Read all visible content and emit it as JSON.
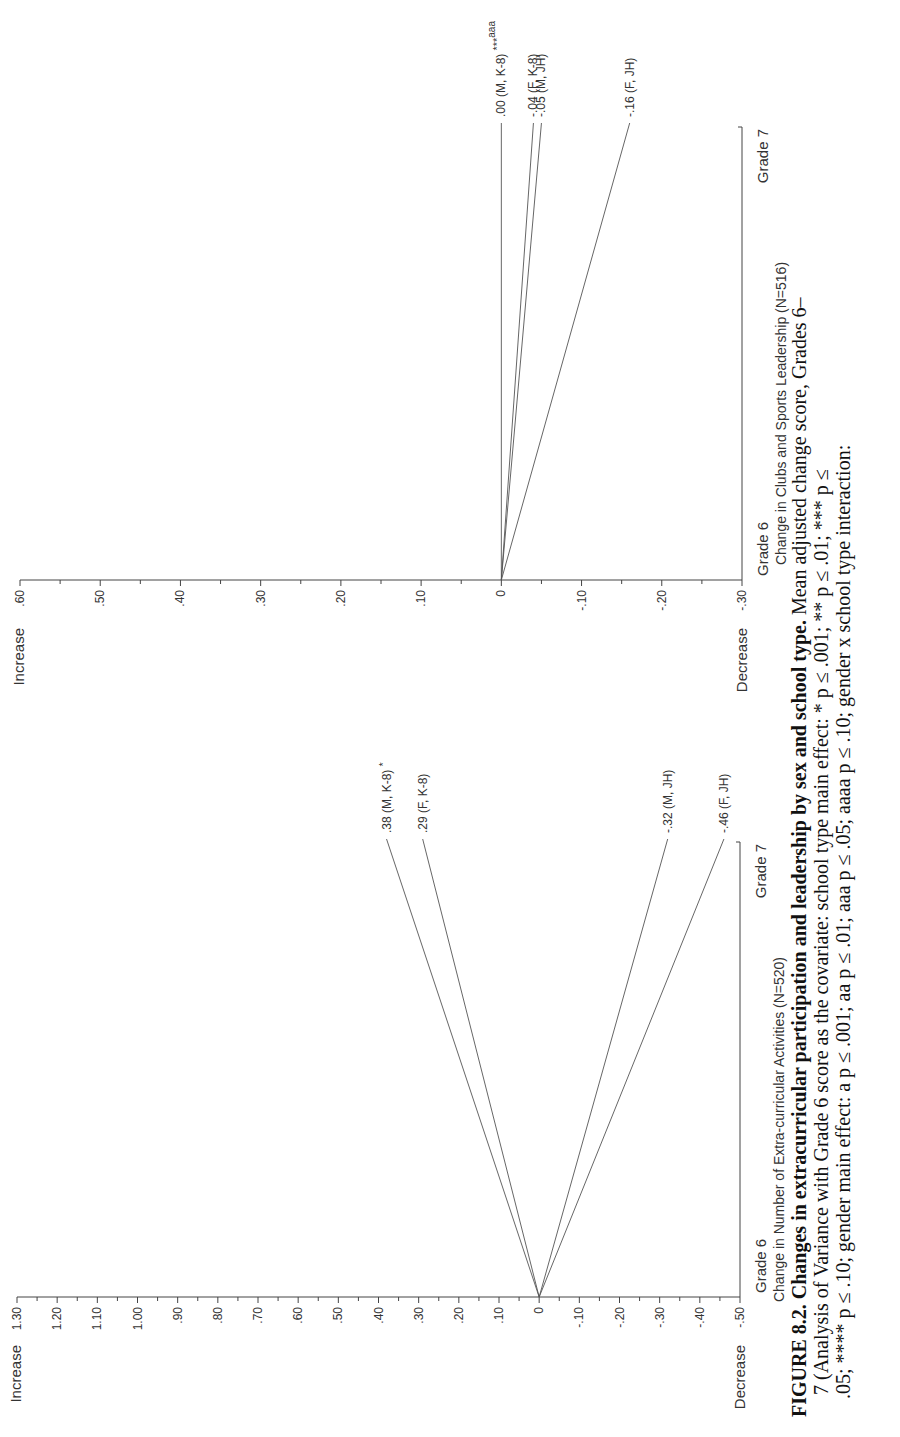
{
  "figure": {
    "caption_label": "FIGURE 8.2.",
    "caption_title": "Changes in extracurricular participation and leadership by sex and school type.",
    "caption_line1_rest": "Mean adjusted change score, Grades 6–",
    "caption_line2": "7 (Analysis of Variance with Grade 6 score as the covariate: school type main effect: * p ≤ .001; ** p ≤ .01; *** p ≤",
    "caption_line3": ".05; **** p ≤ .10; gender main effect: a p ≤ .001; aa p ≤ .01; aaa p ≤ .05; aaaa p ≤ .10; gender x school type interaction:"
  },
  "chart_data": [
    {
      "type": "line",
      "title": "Change in Number of Extra-curricular Activities (N=520)",
      "xlabel": "Change in Number of Extra-curricular Activities (N=520)",
      "x": [
        "Grade 6",
        "Grade 7"
      ],
      "ylabel_top": "Increase",
      "ylabel_bottom": "Decrease",
      "ylim": [
        -0.5,
        1.3
      ],
      "yticks": [
        "1.30",
        "1.20",
        "1.10",
        "1.00",
        ".90",
        ".80",
        ".70",
        ".60",
        ".50",
        ".40",
        ".30",
        ".20",
        ".10",
        "0",
        "-.10",
        "-.20",
        "-.30",
        "-.40",
        "-.50"
      ],
      "grid": false,
      "series": [
        {
          "name": "M, K-8",
          "values": [
            0,
            0.38
          ],
          "label": ".38 (M, K-8)",
          "marker": "*"
        },
        {
          "name": "F, K-8",
          "values": [
            0,
            0.29
          ],
          "label": ".29 (F, K-8)",
          "marker": ""
        },
        {
          "name": "M, JH",
          "values": [
            0,
            -0.32
          ],
          "label": "-.32 (M, JH)",
          "marker": ""
        },
        {
          "name": "F, JH",
          "values": [
            0,
            -0.46
          ],
          "label": "-.46 (F, JH)",
          "marker": ""
        }
      ]
    },
    {
      "type": "line",
      "title": "Change in Clubs and Sports Leadership (N=516)",
      "xlabel": "Change in Clubs and Sports Leadership (N=516)",
      "x": [
        "Grade 6",
        "Grade 7"
      ],
      "ylabel_top": "Increase",
      "ylabel_bottom": "Decrease",
      "ylim": [
        -0.3,
        0.6
      ],
      "yticks": [
        ".60",
        ".50",
        ".40",
        ".30",
        ".20",
        ".10",
        "0",
        "-.10",
        "-.20",
        "-.30"
      ],
      "grid": false,
      "series": [
        {
          "name": "M, K-8",
          "values": [
            0,
            0.0
          ],
          "label": ".00 (M, K-8)",
          "marker": "***",
          "superscript": "aaa"
        },
        {
          "name": "F, K-8",
          "values": [
            0,
            -0.04
          ],
          "label": "-.04 (F, K-8)",
          "marker": ""
        },
        {
          "name": "M, JH",
          "values": [
            0,
            -0.05
          ],
          "label": "-.05 (M, JH)",
          "marker": ""
        },
        {
          "name": "F, JH",
          "values": [
            0,
            -0.16
          ],
          "label": "-.16 (F, JH)",
          "marker": ""
        }
      ]
    }
  ]
}
